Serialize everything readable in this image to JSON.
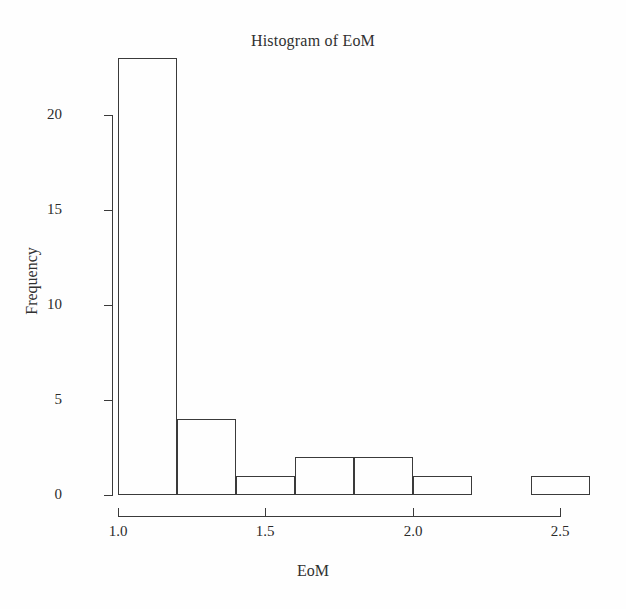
{
  "chart_data": {
    "type": "bar",
    "title": "Histogram of EoM",
    "xlabel": "EoM",
    "ylabel": "Frequency",
    "subtitle": "",
    "grid": false,
    "legend": false,
    "bin_width": 0.2,
    "bin_edges": [
      1.0,
      1.2,
      1.4,
      1.6,
      1.8,
      2.0,
      2.2,
      2.4,
      2.6
    ],
    "categories": [
      "1.0-1.2",
      "1.2-1.4",
      "1.4-1.6",
      "1.6-1.8",
      "1.8-2.0",
      "2.0-2.2",
      "2.2-2.4",
      "2.4-2.6"
    ],
    "values": [
      23,
      4,
      1,
      2,
      2,
      1,
      0,
      1
    ],
    "xlim": [
      1.0,
      2.6
    ],
    "ylim": [
      0,
      23
    ],
    "xticks": [
      1.0,
      1.5,
      2.0,
      2.5
    ],
    "xtick_labels": [
      "1.0",
      "1.5",
      "2.0",
      "2.5"
    ],
    "yticks": [
      0,
      5,
      10,
      15,
      20
    ],
    "ytick_labels": [
      "0",
      "5",
      "10",
      "15",
      "20"
    ],
    "bar_edge_color": "#3a3a3a",
    "bar_fill_color": "transparent",
    "axis_color": "#3a3a3a",
    "background_color": "#fefefe"
  }
}
